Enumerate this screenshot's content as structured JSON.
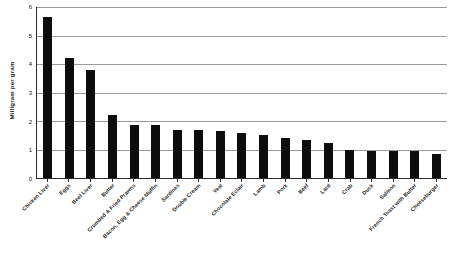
{
  "chart_data": {
    "type": "bar",
    "title": "",
    "subtitle": "",
    "xlabel": "",
    "ylabel": "Milligram per gram",
    "ylim": [
      0,
      6
    ],
    "yticks": [
      0,
      1,
      2,
      3,
      4,
      5,
      6
    ],
    "grid": true,
    "legend": false,
    "bar_color": "#0d0d0d",
    "categories": [
      "Chicken Liver",
      "Eggs",
      "Beef Liver",
      "Butter",
      "Crumbed & Fried Prawns",
      "Bacon, Egg & Cheese Muffin",
      "Sardines",
      "Double Cream",
      "Veal",
      "Chocolate Eclair",
      "Lamb",
      "Pork",
      "Beef",
      "Lard",
      "Crab",
      "Duck",
      "Salmon",
      "French Toast with Butter",
      "Cheeseburger"
    ],
    "values": [
      5.65,
      4.2,
      3.78,
      2.2,
      1.85,
      1.85,
      1.7,
      1.7,
      1.65,
      1.58,
      1.5,
      1.42,
      1.35,
      1.22,
      1.0,
      0.95,
      0.95,
      0.95,
      0.85
    ]
  }
}
